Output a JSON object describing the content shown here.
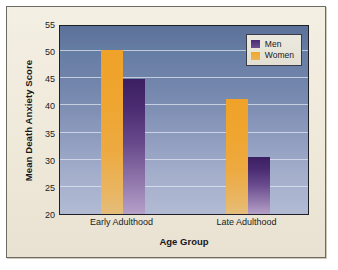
{
  "chart_data": {
    "type": "bar",
    "title": "",
    "xlabel": "Age Group",
    "ylabel": "Mean Death Anxiety Score",
    "categories": [
      "Early Adulthood",
      "Late Adulthood"
    ],
    "series": [
      {
        "name": "Men",
        "values": [
          44.8,
          30.5
        ],
        "color": "#4a2a74"
      },
      {
        "name": "Women",
        "values": [
          50.3,
          41.2
        ],
        "color": "#f0a229"
      }
    ],
    "series_order_in_plot": [
      "Women",
      "Men"
    ],
    "ylim": [
      20,
      55
    ],
    "ytick_step": 5,
    "yticks": [
      20,
      25,
      30,
      35,
      40,
      45,
      50,
      55
    ],
    "ytick_labels": [
      "20",
      "25",
      "30",
      "35",
      "40",
      "45",
      "50",
      "55"
    ],
    "grid": true,
    "grid_axis": "y",
    "legend_position": "top-right",
    "legend_entries": [
      "Men",
      "Women"
    ],
    "plot_background": "#5c7199",
    "figure_background": "#f1ece0"
  }
}
